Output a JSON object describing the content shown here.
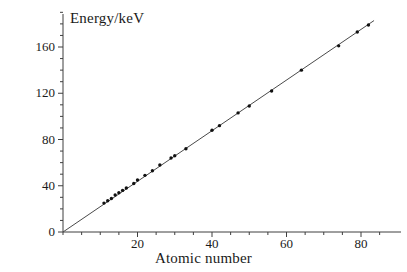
{
  "chart_data": {
    "type": "scatter",
    "title": "",
    "xlabel": "Atomic number",
    "ylabel": "Energy/keV",
    "xlim": [
      0,
      85
    ],
    "ylim": [
      0,
      190
    ],
    "grid": false,
    "legend": null,
    "xticks": [
      20,
      40,
      60,
      80
    ],
    "yticks": [
      0,
      40,
      80,
      120,
      160
    ],
    "xminor_step": 5,
    "yminor_step": 10,
    "marker": "dot",
    "line": "best-fit straight line through origin",
    "x": [
      11,
      12,
      13,
      14,
      15,
      16,
      17,
      19,
      20,
      22,
      24,
      26,
      29,
      30,
      33,
      40,
      42,
      47,
      50,
      56,
      64,
      74,
      79,
      82
    ],
    "y": [
      25,
      27,
      29,
      32,
      34,
      36,
      38,
      42,
      45,
      49,
      53,
      58,
      64,
      66,
      72,
      88,
      92,
      103,
      109,
      122,
      140,
      161,
      173,
      179
    ],
    "points": [
      {
        "x": 11,
        "y": 25
      },
      {
        "x": 12,
        "y": 27
      },
      {
        "x": 13,
        "y": 29
      },
      {
        "x": 14,
        "y": 32
      },
      {
        "x": 15,
        "y": 34
      },
      {
        "x": 16,
        "y": 36
      },
      {
        "x": 17,
        "y": 38
      },
      {
        "x": 19,
        "y": 42
      },
      {
        "x": 20,
        "y": 45
      },
      {
        "x": 22,
        "y": 49
      },
      {
        "x": 24,
        "y": 53
      },
      {
        "x": 26,
        "y": 58
      },
      {
        "x": 29,
        "y": 64
      },
      {
        "x": 30,
        "y": 66
      },
      {
        "x": 33,
        "y": 72
      },
      {
        "x": 40,
        "y": 88
      },
      {
        "x": 42,
        "y": 92
      },
      {
        "x": 47,
        "y": 103
      },
      {
        "x": 50,
        "y": 109
      },
      {
        "x": 56,
        "y": 122
      },
      {
        "x": 64,
        "y": 140
      },
      {
        "x": 74,
        "y": 161
      },
      {
        "x": 79,
        "y": 173
      },
      {
        "x": 82,
        "y": 179
      }
    ],
    "fit_line": {
      "slope": 2.19,
      "intercept": 0.0,
      "x_start": 0,
      "x_end": 83.5
    },
    "colors": {
      "axis": "#3f3f3f",
      "line": "#4a4a4a",
      "marker": "#111111",
      "text": "#1a1a1a",
      "background": "#ffffff"
    }
  },
  "axis_titles": {
    "y": "Energy/keV",
    "x": "Atomic number"
  },
  "tick_text": {
    "y": [
      "0",
      "40",
      "80",
      "120",
      "160"
    ],
    "x": [
      "20",
      "40",
      "60",
      "80"
    ]
  }
}
